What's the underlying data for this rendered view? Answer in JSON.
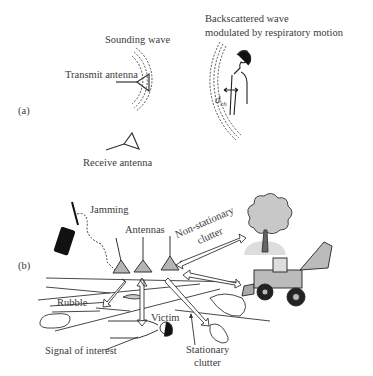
{
  "panel_a": {
    "label": "(a)",
    "sounding_wave": "Sounding wave",
    "transmit_antenna": "Transmit antenna",
    "receive_antenna": "Receive antenna",
    "backscatter_line1": "Backscattered wave",
    "backscatter_line2": "modulated  by respiratory motion",
    "chest_symbol": "d",
    "chest_subscript": "ch"
  },
  "panel_b": {
    "label": "(b)",
    "jamming": "Jamming",
    "antennas": "Antennas",
    "nonstationary_line1": "Non-stationary",
    "nonstationary_line2": "clutter",
    "rubble": "Rubble",
    "victim": "Victim",
    "signal_of_interest": "Signal of interest",
    "stationary_line1": "Stationary",
    "stationary_line2": "clutter"
  },
  "colors": {
    "antenna_fill": "#b5b5b5",
    "tree_fill": "#c8c8c8",
    "line": "#333333"
  }
}
